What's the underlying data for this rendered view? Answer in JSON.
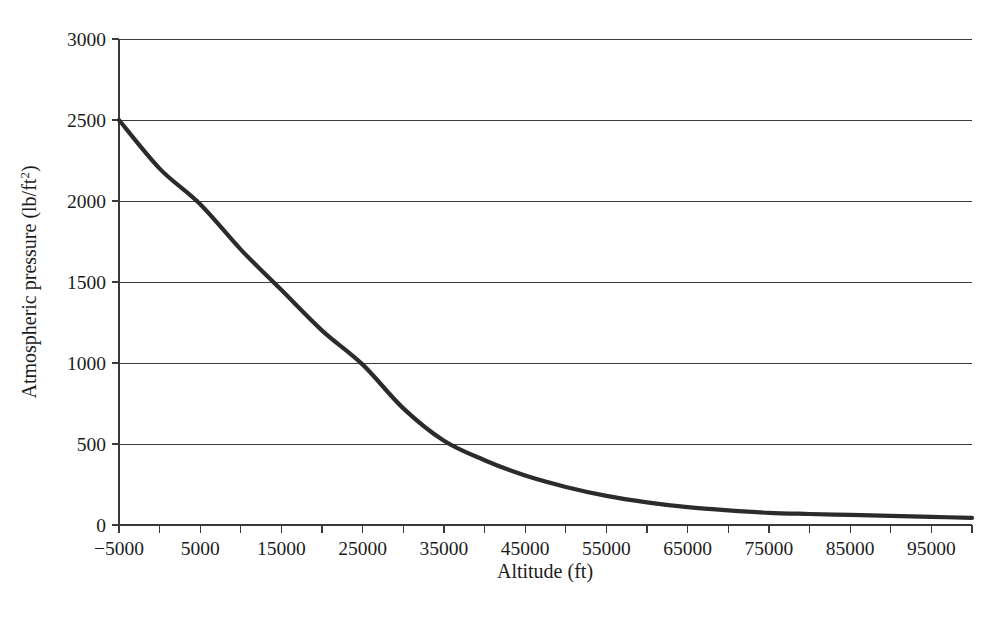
{
  "chart_data": {
    "type": "line",
    "title": "",
    "xlabel": "Altitude (ft)",
    "ylabel": "Atmospheric pressure (lb/ft2)",
    "ylabel_base": "Atmospheric pressure (lb/ft",
    "ylabel_sup": "2",
    "ylabel_close": ")",
    "xlim": [
      -5000,
      100000
    ],
    "ylim": [
      0,
      3000
    ],
    "grid": true,
    "legend": "none",
    "x_ticks_labeled": [
      -5000,
      5000,
      15000,
      25000,
      35000,
      45000,
      55000,
      65000,
      75000,
      85000,
      95000
    ],
    "x_tick_labels": [
      "−5000",
      "5000",
      "15000",
      "25000",
      "35000",
      "45000",
      "55000",
      "65000",
      "75000",
      "85000",
      "95000"
    ],
    "x_ticks_minor": [
      0,
      10000,
      20000,
      30000,
      40000,
      50000,
      60000,
      70000,
      80000,
      90000,
      100000
    ],
    "y_ticks": [
      0,
      500,
      1000,
      1500,
      2000,
      2500,
      3000
    ],
    "y_tick_labels": [
      "0",
      "500",
      "1000",
      "1500",
      "2000",
      "2500",
      "3000"
    ],
    "series": [
      {
        "name": "Atmospheric pressure",
        "color": "#2b2b2b",
        "x": [
          -5000,
          0,
          5000,
          10000,
          15000,
          20000,
          25000,
          30000,
          35000,
          40000,
          45000,
          50000,
          55000,
          60000,
          65000,
          70000,
          75000,
          80000,
          85000,
          90000,
          95000,
          100000
        ],
        "y": [
          2500,
          2200,
          1980,
          1700,
          1450,
          1200,
          990,
          720,
          520,
          400,
          305,
          235,
          180,
          140,
          110,
          90,
          75,
          68,
          62,
          56,
          50,
          44
        ]
      }
    ]
  },
  "geometry": {
    "plot_left": 119,
    "plot_right": 972,
    "plot_top": 39,
    "plot_bottom": 525
  }
}
